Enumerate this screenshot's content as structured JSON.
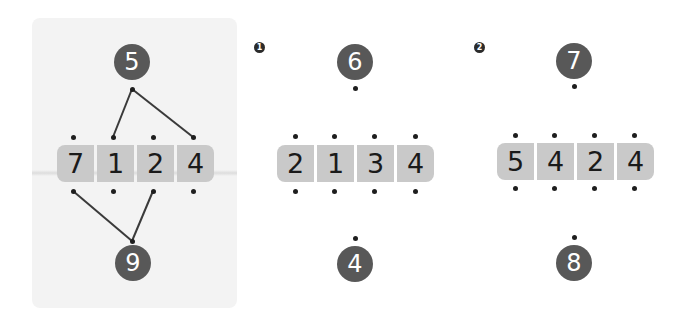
{
  "colors": {
    "bubble": "#585858",
    "cell": "#c9c9c9",
    "dot": "#1e1e1e",
    "panel_bg": "#f3f3f3",
    "line": "#3a3a3a"
  },
  "example": {
    "top_number": "5",
    "bottom_number": "9",
    "digits": [
      "7",
      "1",
      "2",
      "4"
    ],
    "top_links": [
      1,
      3
    ],
    "bottom_links": [
      0,
      2
    ]
  },
  "problems": [
    {
      "badge": "1",
      "top_number": "6",
      "bottom_number": "4",
      "digits": [
        "2",
        "1",
        "3",
        "4"
      ]
    },
    {
      "badge": "2",
      "top_number": "7",
      "bottom_number": "8",
      "digits": [
        "5",
        "4",
        "2",
        "4"
      ]
    }
  ]
}
